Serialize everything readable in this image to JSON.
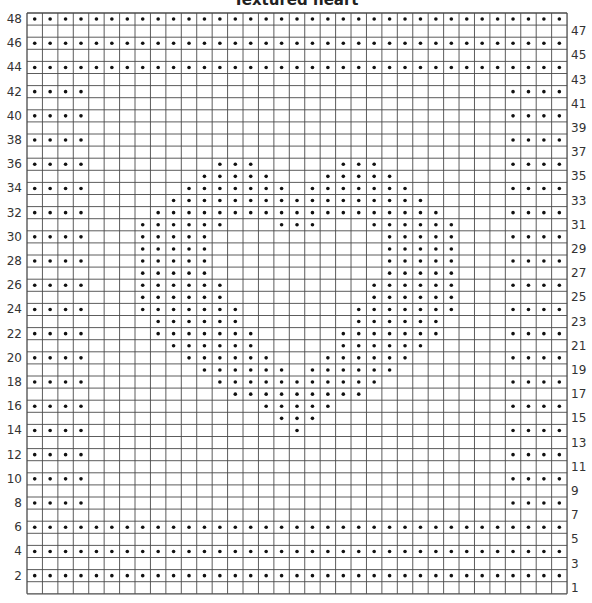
{
  "chart": {
    "title": "Textured heart",
    "columns": 35,
    "rows": 48,
    "cell_width": 15.43,
    "cell_height": 12.1,
    "left_labels": [
      48,
      46,
      44,
      42,
      40,
      38,
      36,
      34,
      32,
      30,
      28,
      26,
      24,
      22,
      20,
      18,
      16,
      14,
      12,
      10,
      8,
      6,
      4,
      2
    ],
    "right_labels": [
      47,
      45,
      43,
      41,
      39,
      37,
      35,
      33,
      31,
      29,
      27,
      25,
      23,
      21,
      19,
      17,
      15,
      13,
      11,
      9,
      7,
      5,
      3,
      1
    ],
    "colors": {
      "grid_line": "#4a4a4a",
      "dot": "#111111",
      "background": "#ffffff"
    },
    "legend_symbol": "dot = purl stitch",
    "dot_rows": {
      "48": "0-34",
      "46": "0-34",
      "44": "0-34",
      "42": "0-3,31-34",
      "40": "0-3,31-34",
      "38": "0-3,31-34",
      "36": "0-3,12-14,20-22,31-34",
      "35": "11-15,19-23",
      "34": "0-3,10-16,18-24,31-34",
      "33": "9-25",
      "32": "0-3,8-26,31-34",
      "31": "7-12,16-18,22-27",
      "30": "0-3,7-11,23-27,31-34",
      "29": "7-11,23-27",
      "28": "0-3,7-11,23-27,31-34",
      "27": "7-11,23-27",
      "26": "0-3,7-12,22-27,31-34",
      "25": "7-12,22-27",
      "24": "0-3,7-13,21-27,31-34",
      "23": "8-13,21-26",
      "22": "0-3,8-14,20-26,31-34",
      "21": "9-14,20-25",
      "20": "0-3,10-15,19-24,31-34",
      "19": "11-16,18-23",
      "18": "0-3,12-22,31-34",
      "17": "13-21",
      "16": "0-3,15-19,31-34",
      "15": "16-18",
      "14": "0-3,17,31-34",
      "12": "0-3,31-34",
      "10": "0-3,31-34",
      "8": "0-3,31-34",
      "6": "0-34",
      "4": "0-34",
      "2": "0-34"
    }
  }
}
